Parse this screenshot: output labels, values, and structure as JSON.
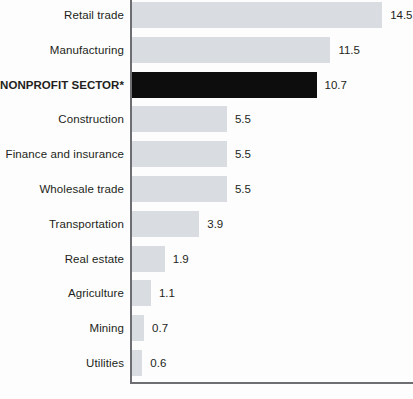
{
  "chart_data": {
    "type": "bar",
    "orientation": "horizontal",
    "title": "",
    "subtitle": "",
    "xlabel": "",
    "ylabel": "",
    "xlim": [
      0,
      14.5
    ],
    "grid": false,
    "legend": null,
    "highlighted_category": "NONPROFIT SECTOR*",
    "categories": [
      "Retail trade",
      "Manufacturing",
      "NONPROFIT SECTOR*",
      "Construction",
      "Finance and insurance",
      "Wholesale trade",
      "Transportation",
      "Real estate",
      "Agriculture",
      "Mining",
      "Utilities"
    ],
    "values": [
      14.5,
      11.5,
      10.7,
      5.5,
      5.5,
      5.5,
      3.9,
      1.9,
      1.1,
      0.7,
      0.6
    ],
    "value_labels": [
      "14.5",
      "11.5",
      "10.7",
      "5.5",
      "5.5",
      "5.5",
      "3.9",
      "1.9",
      "1.1",
      "0.7",
      "0.6"
    ],
    "colors": {
      "bar": "#d9dde1",
      "bar_highlight": "#0d0d0d",
      "axis": "#6d6e71",
      "text": "#231f20",
      "background": "#ffffff"
    }
  }
}
